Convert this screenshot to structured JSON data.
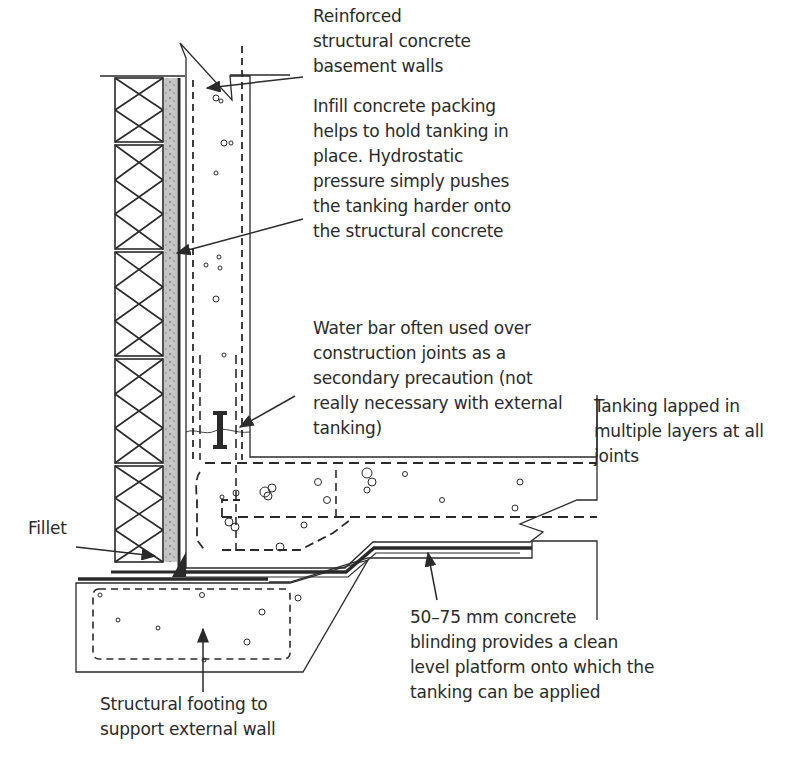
{
  "diagram": {
    "type": "construction section detail",
    "colors": {
      "line": "#2a2a2a",
      "background": "#ffffff",
      "insulation_fill": "#b8b8b8"
    },
    "labels": {
      "basement_walls": "Reinforced\nstructural concrete\nbasement walls",
      "infill_packing": "Infill concrete packing\nhelps to hold tanking in\nplace.  Hydrostatic\npressure simply pushes\nthe tanking harder onto\nthe structural concrete",
      "water_bar": "Water bar often used over\nconstruction joints as a\nsecondary precaution (not\nreally necessary with external\ntanking)",
      "tanking_lapped": "Tanking  lapped in\nmultiple layers at all\njoints",
      "fillet": "Fillet",
      "blinding": "50–75 mm concrete\nblinding provides a clean\nlevel platform onto which the\ntanking can be applied",
      "footing": "Structural footing to\nsupport external wall"
    }
  }
}
